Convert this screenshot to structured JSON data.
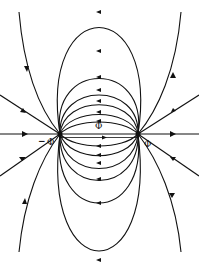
{
  "figure": {
    "labels": {
      "center_top": "Φ",
      "left_charge": "Φ",
      "right_charge": "Φ",
      "left_marker": "−"
    },
    "charges": [
      {
        "name": "left-charge",
        "x": 60,
        "y": 134
      },
      {
        "name": "right-charge",
        "x": 138,
        "y": 134
      }
    ],
    "line_color": "#111111",
    "background": "#ffffff"
  }
}
